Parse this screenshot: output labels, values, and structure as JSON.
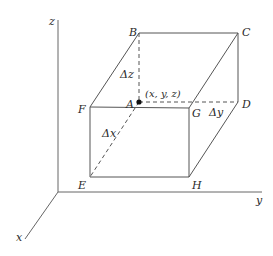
{
  "diagram": {
    "type": "3d-box-coordinate-sketch",
    "colors": {
      "stroke": "#555555",
      "text": "#2a2a2a",
      "point": "#111111"
    },
    "axes": {
      "z": {
        "label": "z"
      },
      "y": {
        "label": "y"
      },
      "x": {
        "label": "x"
      }
    },
    "vertices": {
      "A": "A",
      "B": "B",
      "C": "C",
      "D": "D",
      "E": "E",
      "F": "F",
      "G": "G",
      "H": "H"
    },
    "point_label": "(x, y, z)",
    "dimensions": {
      "dx": "Δx",
      "dy": "Δy",
      "dz": "Δz"
    }
  }
}
